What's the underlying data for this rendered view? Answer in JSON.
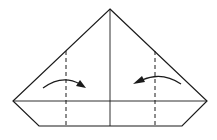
{
  "diagram": {
    "line_color": "#1a1a1a",
    "background": "#ffffff",
    "elements": [
      {
        "name": "outline",
        "kind": "solid-line"
      },
      {
        "name": "center-crease",
        "kind": "solid-line"
      },
      {
        "name": "horizontal-edge",
        "kind": "solid-line"
      },
      {
        "name": "left-valley-fold",
        "kind": "dashed-line"
      },
      {
        "name": "right-valley-fold",
        "kind": "dashed-line"
      },
      {
        "name": "left-fold-arrow",
        "kind": "arrow",
        "direction": "right"
      },
      {
        "name": "right-fold-arrow",
        "kind": "arrow",
        "direction": "left"
      }
    ]
  }
}
